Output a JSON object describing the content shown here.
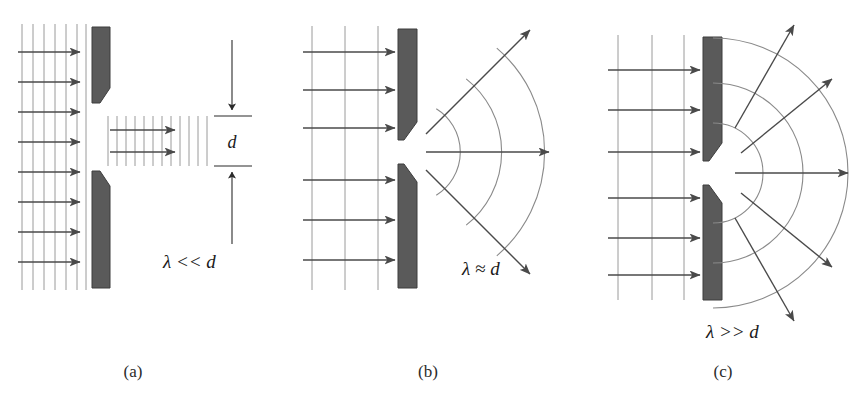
{
  "figure": {
    "background_color": "#ffffff",
    "ink_color": "#3a3a3a",
    "barrier_color": "#5a5a5a",
    "barrier_edge_color": "#3d3d3d",
    "wave_line_color": "#9a9a9a",
    "arc_color": "#8a8a8a",
    "arrow_color": "#4a4a4a"
  },
  "panels": [
    {
      "id": "a",
      "caption": "(a)",
      "condition_label": "λ << d",
      "dimension_label": "d",
      "regime": "wavelength much smaller than slit width",
      "incident_wavefront_count": 6,
      "incident_arrow_count": 8,
      "transmitted_wavefront_count": 11,
      "transmitted_arrow_count": 2,
      "spread_angle_deg": 0,
      "output_arrow_angles_deg": [
        0,
        0
      ]
    },
    {
      "id": "b",
      "caption": "(b)",
      "condition_label": "λ ≈ d",
      "regime": "wavelength comparable to slit width",
      "incident_wavefront_count": 3,
      "incident_arrow_count": 6,
      "arc_count": 3,
      "spread_angle_deg": 90,
      "output_arrow_angles_deg": [
        45,
        0,
        -45
      ]
    },
    {
      "id": "c",
      "caption": "(c)",
      "condition_label": "λ >> d",
      "regime": "wavelength much larger than slit width",
      "incident_wavefront_count": 3,
      "incident_arrow_count": 6,
      "arc_count": 3,
      "spread_angle_deg": 180,
      "output_arrow_angles_deg": [
        66,
        33,
        0,
        -33,
        -66
      ]
    }
  ]
}
